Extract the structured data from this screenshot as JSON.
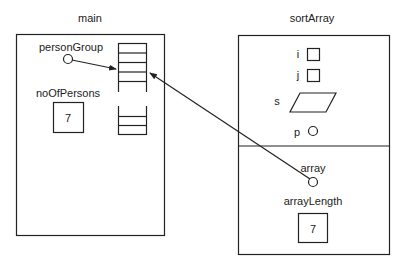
{
  "frames": [
    {
      "name": "main",
      "variables": [
        {
          "name": "personGroup",
          "kind": "pointer"
        },
        {
          "name": "noOfPersons",
          "kind": "int",
          "value": "7"
        }
      ],
      "array_cells_top": 4,
      "array_cells_bottom": 2
    },
    {
      "name": "sortArray",
      "locals": [
        {
          "name": "i",
          "kind": "int"
        },
        {
          "name": "j",
          "kind": "int"
        },
        {
          "name": "s",
          "kind": "struct"
        },
        {
          "name": "p",
          "kind": "pointer"
        }
      ],
      "params": [
        {
          "name": "array",
          "kind": "pointer"
        },
        {
          "name": "arrayLength",
          "kind": "int",
          "value": "7"
        }
      ]
    }
  ]
}
